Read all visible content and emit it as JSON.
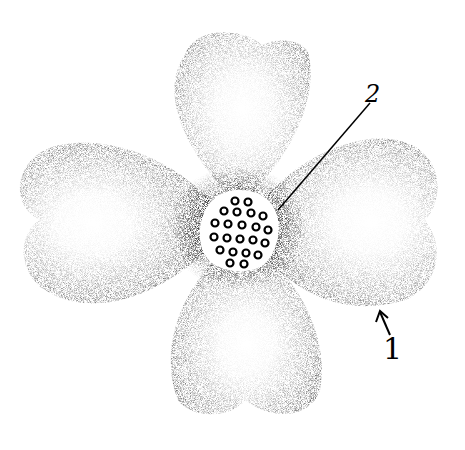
{
  "figure": {
    "petal_count": 4,
    "colors": {
      "ink": "#000000",
      "background": "#ffffff",
      "shade_dark": "#1a1a1a",
      "shade_mid": "#6e6e6e",
      "shade_light": "#d9d9d9"
    }
  },
  "labels": [
    {
      "id": "2",
      "text": "2",
      "points_to": "center flower cluster"
    },
    {
      "id": "1",
      "text": "1",
      "points_to": "petal (bract) edge"
    }
  ]
}
